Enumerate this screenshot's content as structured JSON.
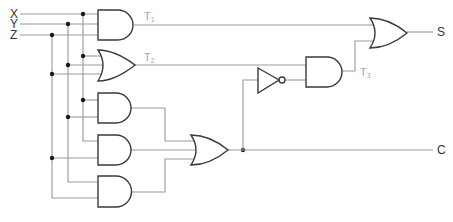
{
  "diagram": {
    "type": "logic-circuit",
    "inputs": [
      {
        "name": "X",
        "label": "X"
      },
      {
        "name": "Y",
        "label": "Y"
      },
      {
        "name": "Z",
        "label": "Z"
      }
    ],
    "outputs": [
      {
        "name": "S",
        "label": "S"
      },
      {
        "name": "C",
        "label": "C"
      }
    ],
    "intermediate_labels": [
      {
        "name": "T1",
        "main": "T",
        "sub": "1"
      },
      {
        "name": "T2",
        "main": "T",
        "sub": "2"
      },
      {
        "name": "T3",
        "main": "T",
        "sub": "3"
      }
    ],
    "gates": [
      {
        "id": "and1",
        "type": "AND",
        "inputs": [
          "X",
          "Y",
          "Z"
        ],
        "output": "T1"
      },
      {
        "id": "or1",
        "type": "OR",
        "inputs": [
          "X",
          "Y",
          "Z"
        ],
        "output": "T2"
      },
      {
        "id": "and2",
        "type": "AND",
        "inputs": [
          "X",
          "Y"
        ],
        "output": "XY"
      },
      {
        "id": "and3",
        "type": "AND",
        "inputs": [
          "X",
          "Z"
        ],
        "output": "XZ"
      },
      {
        "id": "and4",
        "type": "AND",
        "inputs": [
          "Y",
          "Z"
        ],
        "output": "YZ"
      },
      {
        "id": "or2",
        "type": "OR",
        "inputs": [
          "XY",
          "XZ",
          "YZ"
        ],
        "output": "C"
      },
      {
        "id": "not1",
        "type": "NOT",
        "inputs": [
          "C"
        ],
        "output": "C'"
      },
      {
        "id": "and5",
        "type": "AND",
        "inputs": [
          "T2",
          "C'"
        ],
        "output": "T3"
      },
      {
        "id": "or3",
        "type": "OR",
        "inputs": [
          "T1",
          "T3"
        ],
        "output": "S"
      }
    ],
    "colors": {
      "wire": "#9a9a9a",
      "gate_outline": "#3a3a3a",
      "junction": "#1a1a1a",
      "label": "#333333",
      "t_label": "#a8a8a8"
    }
  }
}
